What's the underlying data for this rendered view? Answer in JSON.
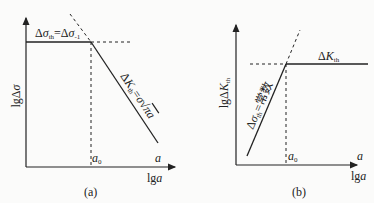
{
  "panels": [
    {
      "id": "a",
      "caption": "(a)",
      "y_axis_label": "lgΔσ",
      "x_axis_label": "lga",
      "x_axis_end_label": "a",
      "x_marker_label": "a₀",
      "horizontal_line_label": "Δσth=Δσ-1",
      "diagonal_line_label": "ΔKth=σ√πa"
    },
    {
      "id": "b",
      "caption": "(b)",
      "y_axis_label": "lgΔKth",
      "x_axis_label": "lga",
      "x_axis_end_label": "a",
      "x_marker_label": "a₀",
      "horizontal_line_label": "ΔKth",
      "diagonal_line_label": "Δσth=常数"
    }
  ],
  "colors": {
    "line": "#222222",
    "background": "#fbfbfa"
  }
}
